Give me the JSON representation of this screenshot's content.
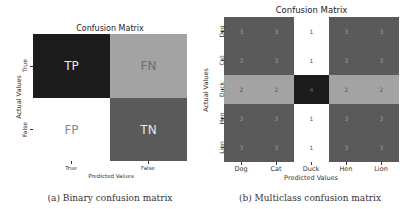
{
  "chart_data": [
    {
      "type": "heatmap",
      "title": "Confusion Matrix",
      "xlabel": "Predicted Values",
      "ylabel": "Actual Values",
      "x_categories": [
        "True",
        "False"
      ],
      "y_categories": [
        "True",
        "False"
      ],
      "cells": [
        [
          "TP",
          "FN"
        ],
        [
          "FP",
          "TN"
        ]
      ],
      "cell_colors": [
        [
          "#1c1c1c",
          "#a3a3a3"
        ],
        [
          "#ffffff",
          "#5a5a5a"
        ]
      ],
      "text_colors": [
        [
          "#e6e6e6",
          "#6e6e6e"
        ],
        [
          "#8a8a8a",
          "#e6e6e6"
        ]
      ],
      "caption": "(a) Binary confusion matrix",
      "colorbar": false
    },
    {
      "type": "heatmap",
      "title": "Confusion Matrix",
      "xlabel": "Predicted Values",
      "ylabel": "Actual Values",
      "x_categories": [
        "Dog",
        "Cat",
        "Duck",
        "Hen",
        "Lion"
      ],
      "y_categories": [
        "Dog",
        "Cat",
        "Duck",
        "Hen",
        "Lion"
      ],
      "values": [
        [
          3,
          3,
          1,
          3,
          3
        ],
        [
          3,
          3,
          1,
          3,
          3
        ],
        [
          2,
          2,
          4,
          2,
          2
        ],
        [
          3,
          3,
          1,
          3,
          3
        ],
        [
          3,
          3,
          1,
          3,
          3
        ]
      ],
      "color_scale": {
        "1": "#ffffff",
        "2": "#a3a3a3",
        "3": "#5a5a5a",
        "4": "#1c1c1c"
      },
      "text_colors": {
        "1": "#555555",
        "2": "#555555",
        "3": "#9a9a9a",
        "4": "#666666"
      },
      "caption": "(b) Multiclass confusion matrix",
      "colorbar": false
    }
  ],
  "binary": {
    "title": "Confusion Matrix",
    "xlabel": "Predicted Values",
    "ylabel": "Actual Values",
    "xticks": [
      "True",
      "False"
    ],
    "yticks": [
      "True",
      "False"
    ],
    "cells": {
      "tp": "TP",
      "fn": "FN",
      "fp": "FP",
      "tn": "TN"
    },
    "caption": "(a) Binary confusion matrix"
  },
  "multi": {
    "title": "Confusion Matrix",
    "xlabel": "Predicted Values",
    "ylabel": "Actual Values",
    "xticks": [
      "Dog",
      "Cat",
      "Duck",
      "Hen",
      "Lion"
    ],
    "yticks": [
      "Dog",
      "Cat",
      "Duck",
      "Hen",
      "Lion"
    ],
    "caption": "(b) Multiclass confusion matrix"
  }
}
